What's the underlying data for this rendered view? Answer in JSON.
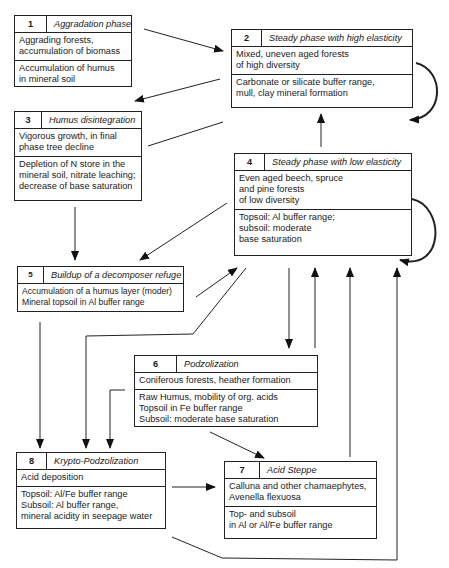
{
  "diagram": {
    "boxes": [
      {
        "id": 1,
        "number": "1",
        "title": "Aggradation phase",
        "vegetation": "Aggrading forests,\naccumulation of biomass",
        "soil": "Accumulation of humus\nin mineral soil"
      },
      {
        "id": 2,
        "number": "2",
        "title": "Steady phase with high elasticity",
        "vegetation": "Mixed, uneven aged forests\nof high diversity",
        "soil": "Carbonate or silicate buffer range,\nmull, clay mineral formation"
      },
      {
        "id": 3,
        "number": "3",
        "title": "Humus disintegration",
        "vegetation": "Vigorous growth, in final\nphase tree decline",
        "soil": "Depletion of N store in the\nmineral soil, nitrate leaching;\ndecrease of base saturation"
      },
      {
        "id": 4,
        "number": "4",
        "title": "Steady phase with low elasticity",
        "vegetation": "Even aged beech, spruce\nand pine forests\nof low diversity",
        "soil": "Topsoil: Al buffer range;\nsubsoil: moderate\nbase saturation"
      },
      {
        "id": 5,
        "number": "5",
        "title": "Buildup of a decomposer refuge",
        "soil": "Accumulation of a humus layer (moder)\nMineral topsoil in Al buffer range"
      },
      {
        "id": 6,
        "number": "6",
        "title": "Podzolization",
        "vegetation": "Coniferous forests, heather formation",
        "soil": "Raw Humus, mobility of org. acids\nTopsoil in Fe buffer range\nSubsoil: moderate base saturation"
      },
      {
        "id": 7,
        "number": "7",
        "title": "Acid Steppe",
        "vegetation": "Calluna and other chamaephytes,\nAvenella flexuosa",
        "soil": "Top- and subsoil\nin Al or Al/Fe buffer range"
      },
      {
        "id": 8,
        "number": "8",
        "title": "Krypto-Podzolization",
        "vegetation": "Acid deposition",
        "soil": "Topsoil: Al/Fe buffer range\nSubsoil: Al buffer range,\nmineral acidity in seepage water"
      }
    ],
    "transitions": [
      {
        "from": "1",
        "to": "2"
      },
      {
        "from": "2",
        "to": "3"
      },
      {
        "from": "3",
        "to": "2"
      },
      {
        "from": "2",
        "to": "2",
        "kind": "self-loop"
      },
      {
        "from": "4",
        "to": "2"
      },
      {
        "from": "4",
        "to": "4",
        "kind": "self-loop"
      },
      {
        "from": "3",
        "to": "5"
      },
      {
        "from": "4",
        "to": "5"
      },
      {
        "from": "5",
        "to": "4"
      },
      {
        "from": "5",
        "to": "8"
      },
      {
        "from": "4",
        "to": "6"
      },
      {
        "from": "6",
        "to": "4"
      },
      {
        "from": "7",
        "to": "4"
      },
      {
        "from": "8",
        "to": "4"
      },
      {
        "from": "5",
        "to": "8",
        "kind": "via-elbow"
      },
      {
        "from": "6",
        "to": "8"
      },
      {
        "from": "6",
        "to": "7"
      },
      {
        "from": "8",
        "to": "7"
      }
    ]
  }
}
